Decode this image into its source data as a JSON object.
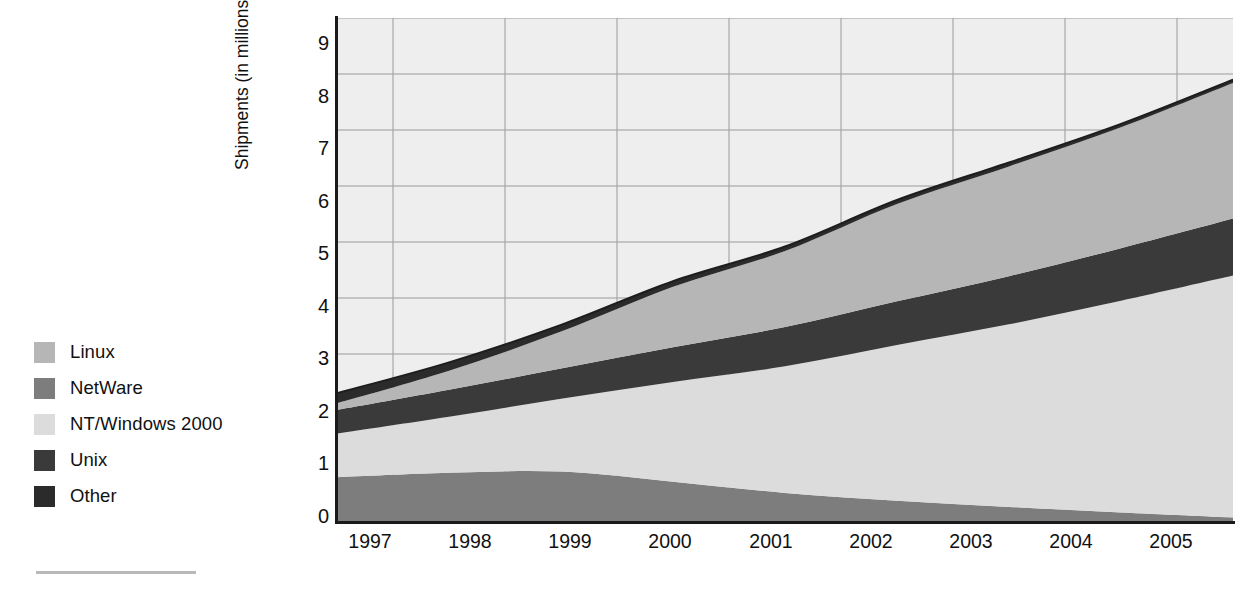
{
  "chart_data": {
    "type": "area",
    "stacked": true,
    "title": "",
    "xlabel": "",
    "ylabel": "Shipments (in millions)",
    "ylim": [
      0,
      9
    ],
    "yticks": [
      "0",
      "1",
      "2",
      "3",
      "4",
      "5",
      "6",
      "7",
      "8",
      "9"
    ],
    "grid": true,
    "legend_position": "left",
    "categories": [
      "1997",
      "1998",
      "1999",
      "2000",
      "2001",
      "2002",
      "2003",
      "2004",
      "2005"
    ],
    "series": [
      {
        "name": "NetWare",
        "color": "#7d7d7d",
        "values": [
          0.8,
          0.88,
          0.9,
          0.72,
          0.52,
          0.38,
          0.27,
          0.17,
          0.08
        ]
      },
      {
        "name": "NT/Windows 2000",
        "color": "#dcdcdc",
        "values": [
          0.78,
          1.0,
          1.3,
          1.78,
          2.26,
          2.78,
          3.26,
          3.78,
          4.32
        ]
      },
      {
        "name": "Unix",
        "color": "#3a3a3a",
        "values": [
          0.42,
          0.48,
          0.54,
          0.62,
          0.7,
          0.78,
          0.86,
          0.94,
          1.02
        ]
      },
      {
        "name": "Linux",
        "color": "#b6b6b6",
        "values": [
          0.12,
          0.34,
          0.66,
          1.08,
          1.36,
          1.74,
          1.96,
          2.16,
          2.42
        ]
      },
      {
        "name": "Other",
        "color": "#2b2b2b",
        "values": [
          0.18,
          0.15,
          0.12,
          0.1,
          0.08,
          0.07,
          0.07,
          0.06,
          0.06
        ]
      }
    ],
    "stack_tops": {
      "NetWare": [
        0.8,
        0.88,
        0.9,
        0.72,
        0.52,
        0.38,
        0.27,
        0.17,
        0.08
      ],
      "NT/Windows 2000": [
        1.58,
        1.88,
        2.2,
        2.5,
        2.78,
        3.16,
        3.53,
        3.95,
        4.4
      ],
      "Unix": [
        2.0,
        2.36,
        2.74,
        3.12,
        3.48,
        3.94,
        4.39,
        4.89,
        5.42
      ],
      "Linux": [
        2.12,
        2.7,
        3.4,
        4.2,
        4.84,
        5.68,
        6.35,
        7.05,
        7.84
      ],
      "Other": [
        2.3,
        2.85,
        3.52,
        4.3,
        4.92,
        5.75,
        6.42,
        7.11,
        7.9
      ]
    },
    "totals": [
      2.3,
      2.85,
      3.52,
      4.3,
      4.92,
      5.75,
      6.42,
      7.11,
      7.9
    ]
  },
  "legend": {
    "items": [
      {
        "label": "Linux",
        "color": "#b6b6b6"
      },
      {
        "label": "NetWare",
        "color": "#7d7d7d"
      },
      {
        "label": "NT/Windows 2000",
        "color": "#dcdcdc"
      },
      {
        "label": "Unix",
        "color": "#3a3a3a"
      },
      {
        "label": "Other",
        "color": "#2b2b2b"
      }
    ]
  },
  "axes": {
    "y_label": "Shipments (in millions)",
    "y_ticks": [
      "9",
      "8",
      "7",
      "6",
      "5",
      "4",
      "3",
      "2",
      "1",
      "0"
    ],
    "x_ticks": [
      "1997",
      "1998",
      "1999",
      "2000",
      "2001",
      "2002",
      "2003",
      "2004",
      "2005"
    ]
  },
  "colors": {
    "plot_background": "#eeeeee",
    "gridline": "#9a9a9a",
    "axis": "#1a1a1a",
    "text": "#111111"
  }
}
